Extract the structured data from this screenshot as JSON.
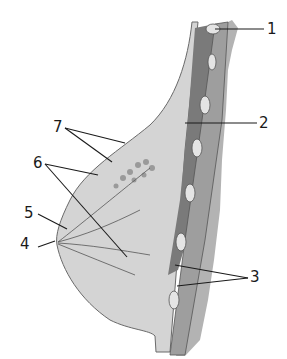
{
  "figure": {
    "labels": [
      {
        "id": "1",
        "text": "1",
        "x": 267,
        "y": 22
      },
      {
        "id": "2",
        "text": "2",
        "x": 259,
        "y": 117
      },
      {
        "id": "3",
        "text": "3",
        "x": 250,
        "y": 270
      },
      {
        "id": "4",
        "text": "4",
        "x": 20,
        "y": 237
      },
      {
        "id": "5",
        "text": "5",
        "x": 24,
        "y": 206
      },
      {
        "id": "6",
        "text": "6",
        "x": 33,
        "y": 156
      },
      {
        "id": "7",
        "text": "7",
        "x": 53,
        "y": 120
      }
    ],
    "colors": {
      "skin_fill": "#c9c9c9",
      "fat_fill": "#d6d6d6",
      "muscle_fill": "#7d7d7d",
      "chest_wall": "#a9a9a9",
      "line": "#1a1a1a"
    }
  }
}
